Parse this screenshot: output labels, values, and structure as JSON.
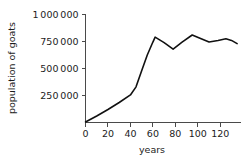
{
  "chart_data": {
    "type": "line",
    "title": "",
    "xlabel": "years",
    "ylabel": "population of goats",
    "xlim": [
      0,
      138
    ],
    "ylim": [
      0,
      1000000
    ],
    "grid": false,
    "legend": null,
    "x_ticks": [
      0,
      20,
      40,
      60,
      80,
      100,
      120
    ],
    "x_tick_labels": [
      "0",
      "20",
      "40",
      "60",
      "80",
      "100",
      "120"
    ],
    "y_ticks": [
      250000,
      500000,
      750000,
      1000000
    ],
    "y_tick_labels": [
      "250 000",
      "500 000",
      "750 000",
      "1 000 000"
    ],
    "series": [
      {
        "name": "population of goats",
        "color": "#111111",
        "x": [
          0,
          10,
          20,
          30,
          40,
          45,
          50,
          55,
          60,
          62,
          70,
          78,
          86,
          95,
          103,
          110,
          118,
          125,
          130,
          135
        ],
        "y": [
          5000,
          60000,
          120000,
          185000,
          255000,
          330000,
          480000,
          625000,
          745000,
          790000,
          740000,
          680000,
          745000,
          810000,
          775000,
          745000,
          760000,
          775000,
          760000,
          730000
        ]
      }
    ]
  },
  "axes": {
    "y_axis_title": "population of goats",
    "x_axis_title": "years"
  }
}
